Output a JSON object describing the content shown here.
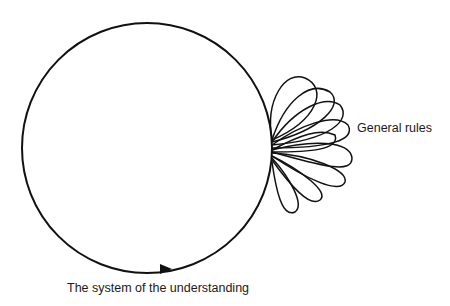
{
  "diagram": {
    "labels": {
      "general_rules": "General rules",
      "system": "The system of the understanding"
    },
    "colors": {
      "stroke": "#111111",
      "background": "#ffffff"
    },
    "circle": {
      "cx": 147,
      "cy": 148,
      "r": 125
    },
    "petal_count": 9
  }
}
